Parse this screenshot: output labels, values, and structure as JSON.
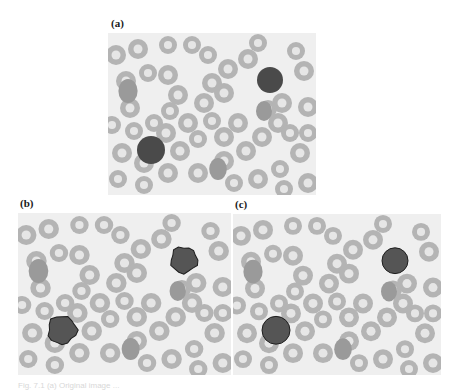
{
  "figure": {
    "panels": [
      {
        "id": "a",
        "label": "(a)",
        "x": 108,
        "y": 33,
        "w": 208,
        "h": 162,
        "label_x": 111,
        "label_y": 17,
        "contour": "none"
      },
      {
        "id": "b",
        "label": "(b)",
        "x": 18,
        "y": 213,
        "w": 213,
        "h": 162,
        "label_x": 20,
        "label_y": 197,
        "contour": "irregular"
      },
      {
        "id": "c",
        "label": "(c)",
        "x": 233,
        "y": 214,
        "w": 208,
        "h": 161,
        "label_x": 235,
        "label_y": 198,
        "contour": "circle"
      }
    ],
    "colors": {
      "background": "#efefef",
      "rbc_fill": "#b4b4b4",
      "rbc_center": "#e6e6e6",
      "nucleus": "#555555",
      "contour": "#1e1e1e"
    },
    "rbcs": [
      [
        8,
        22,
        10
      ],
      [
        30,
        16,
        10
      ],
      [
        18,
        48,
        10
      ],
      [
        40,
        40,
        9
      ],
      [
        60,
        42,
        10
      ],
      [
        22,
        75,
        10
      ],
      [
        4,
        92,
        9
      ],
      [
        26,
        98,
        9
      ],
      [
        46,
        90,
        9
      ],
      [
        62,
        78,
        9
      ],
      [
        70,
        62,
        10
      ],
      [
        58,
        100,
        10
      ],
      [
        80,
        90,
        10
      ],
      [
        90,
        106,
        9
      ],
      [
        72,
        118,
        10
      ],
      [
        96,
        70,
        10
      ],
      [
        104,
        50,
        10
      ],
      [
        120,
        36,
        10
      ],
      [
        116,
        60,
        10
      ],
      [
        104,
        88,
        9
      ],
      [
        116,
        104,
        10
      ],
      [
        130,
        90,
        10
      ],
      [
        140,
        26,
        10
      ],
      [
        150,
        10,
        9
      ],
      [
        90,
        140,
        10
      ],
      [
        116,
        128,
        10
      ],
      [
        138,
        118,
        10
      ],
      [
        154,
        104,
        10
      ],
      [
        160,
        76,
        9
      ],
      [
        174,
        70,
        10
      ],
      [
        170,
        90,
        10
      ],
      [
        182,
        100,
        9
      ],
      [
        196,
        38,
        10
      ],
      [
        188,
        18,
        9
      ],
      [
        200,
        74,
        10
      ],
      [
        192,
        120,
        10
      ],
      [
        172,
        136,
        9
      ],
      [
        150,
        146,
        10
      ],
      [
        126,
        150,
        9
      ],
      [
        60,
        140,
        10
      ],
      [
        36,
        130,
        10
      ],
      [
        14,
        120,
        10
      ],
      [
        10,
        146,
        9
      ],
      [
        36,
        152,
        9
      ],
      [
        200,
        150,
        10
      ],
      [
        176,
        156,
        9
      ],
      [
        84,
        12,
        9
      ],
      [
        100,
        22,
        9
      ],
      [
        60,
        12,
        9
      ],
      [
        200,
        100,
        9
      ]
    ],
    "dense_rbcs": [
      [
        20,
        58,
        12
      ],
      [
        110,
        136,
        11
      ],
      [
        156,
        78,
        10
      ]
    ],
    "nuclei": [
      {
        "cx": 162,
        "cy": 47,
        "r": 13
      },
      {
        "cx": 43,
        "cy": 117,
        "r": 14
      }
    ],
    "caption": "Fig. 7.1  (a) Original image ..."
  }
}
